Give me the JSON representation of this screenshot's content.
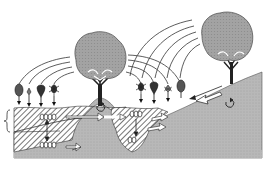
{
  "figure": {
    "title": "",
    "colors": {
      "background": "#ffffff",
      "soil": "#b9b9b9",
      "canopy": "#9a9a9a",
      "line": "#2a2a2a",
      "hatch": "#3a3a3a"
    },
    "elements": {
      "trees": [
        {
          "name": "tree-center",
          "cx": 100,
          "cy": 58
        },
        {
          "name": "tree-right",
          "cx": 232,
          "cy": 38
        }
      ],
      "seeds": [
        {
          "name": "seed-oval",
          "x": 19
        },
        {
          "name": "seed-winged-small",
          "x": 29
        },
        {
          "name": "seed-drop",
          "x": 41
        },
        {
          "name": "seed-spiky",
          "x": 54
        },
        {
          "name": "seed-spiky",
          "x": 141
        },
        {
          "name": "seed-drop",
          "x": 154
        },
        {
          "name": "seed-winged-small",
          "x": 168
        },
        {
          "name": "seed-oval",
          "x": 181
        }
      ],
      "labels": []
    }
  }
}
